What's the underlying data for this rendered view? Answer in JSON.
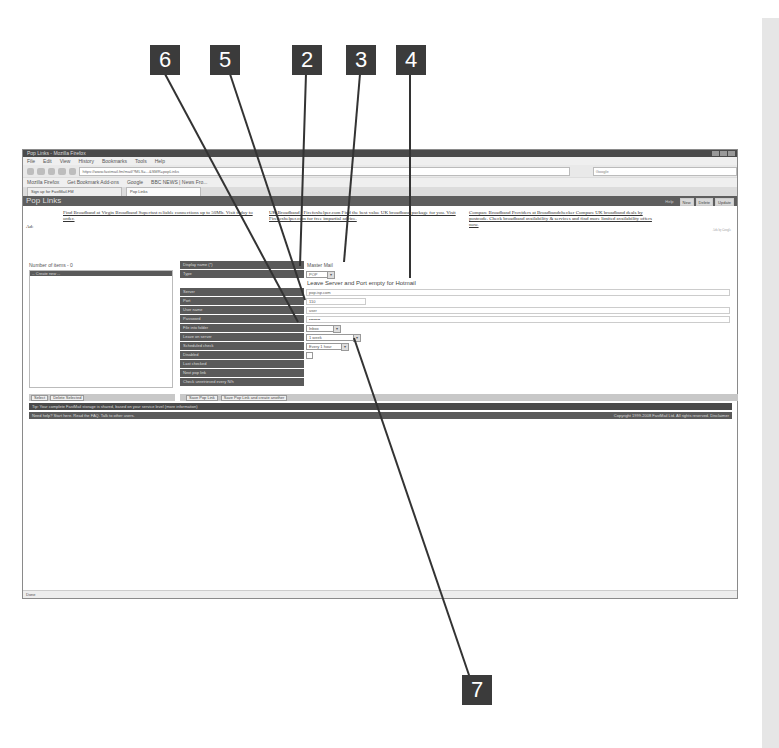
{
  "callouts": [
    {
      "label": "6"
    },
    {
      "label": "5"
    },
    {
      "label": "2"
    },
    {
      "label": "3"
    },
    {
      "label": "4"
    },
    {
      "label": "7"
    }
  ],
  "browser": {
    "title": "Pop Links - Mozilla Firefox",
    "menu": [
      "File",
      "Edit",
      "View",
      "History",
      "Bookmarks",
      "Tools",
      "Help"
    ],
    "url": "https://www.fastmail.fm/mail/?MLS=...&SMR=popLinks",
    "search_placeholder": "Google",
    "bookmarks": [
      "Mozilla Firefox",
      "Get Bookmark Add-ons",
      "Google",
      "BBC NEWS | News Fro..."
    ],
    "tabs": [
      {
        "label": "Sign up for FastMail.FM"
      },
      {
        "label": "Pop Links"
      }
    ],
    "status": "Done"
  },
  "app": {
    "title": "Pop Links",
    "help_link": "Help",
    "buttons": {
      "new": "New",
      "delete": "Delete",
      "update": "Update"
    },
    "ad_label": "Ad:",
    "ads": [
      "Find Broadband at Virgin Broadband Superfast reliable connections up to 50Mb. Visit today to order.",
      "UK Broadband - Firefoxhelper.com Find the best value UK broadband package for you. Visit Firefoxhelper.com for free impartial advice.",
      "Compare Broadband Providers at Broadbandchecker Compare UK broadband deals by postcode. Check broadband availability & services and find more limited availability offers now."
    ],
    "ads_by": "Ads by Google"
  },
  "left_panel": {
    "count_label": "Number of items - 0",
    "selected_item": "-- Create new --",
    "buttons": {
      "select": "Select",
      "delete_selected": "Delete Selected"
    }
  },
  "form": {
    "fields": [
      {
        "label": "Display name (*)",
        "value": "Master Mail",
        "type": "text"
      },
      {
        "label": "Type",
        "value": "POP",
        "type": "select"
      },
      {
        "label": "Server",
        "value": "pop.isp.com",
        "type": "text"
      },
      {
        "label": "Port",
        "value": "110",
        "type": "text"
      },
      {
        "label": "User name",
        "value": "user",
        "type": "text"
      },
      {
        "label": "Password",
        "value": "••••••••",
        "type": "text"
      },
      {
        "label": "File into folder",
        "value": "Inbox",
        "type": "select"
      },
      {
        "label": "Leave on server",
        "value": "1 week",
        "type": "select"
      },
      {
        "label": "Scheduled check",
        "value": "Every 1 hour",
        "type": "select"
      },
      {
        "label": "Disabled",
        "value": "",
        "type": "checkbox"
      },
      {
        "label": "Last checked",
        "value": "",
        "type": "static"
      },
      {
        "label": "Next pop link",
        "value": "",
        "type": "static"
      },
      {
        "label": "Check unretrieved every N/h",
        "value": "",
        "type": "static"
      }
    ],
    "note": "Leave Server and Port empty for Hotmail",
    "buttons": {
      "save": "Save Pop Link",
      "save_create": "Save Pop Link and create another"
    }
  },
  "tip": "Tip: Your complete FastMail storage is shared, based on your service level (more information)",
  "footer": {
    "left": "Need help? Start here. Read the FAQ. Talk to other users.",
    "copyright": "Copyright 1999-2008 FastMail Ltd. All rights reserved. Disclaimer"
  }
}
